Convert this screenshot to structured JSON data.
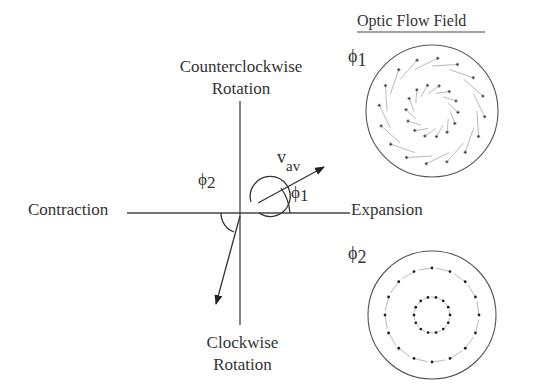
{
  "title": "Optic Flow Field",
  "axes": {
    "top": [
      "Counterclockwise",
      "Rotation"
    ],
    "bottom": [
      "Clockwise",
      "Rotation"
    ],
    "left": "Contraction",
    "right": "Expansion"
  },
  "vector_label": "v",
  "vector_subscript": "av",
  "angle1": {
    "symbol": "ϕ",
    "index": "1"
  },
  "angle2": {
    "symbol": "ϕ",
    "index": "2"
  },
  "field1_label": {
    "symbol": "ϕ",
    "index": "1"
  },
  "field2_label": {
    "symbol": "ϕ",
    "index": "2"
  },
  "colors": {
    "line": "#444444",
    "text": "#333333",
    "faint": "#aaaaaa"
  }
}
